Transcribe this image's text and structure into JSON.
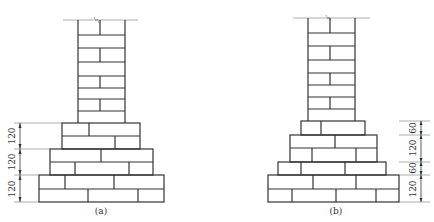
{
  "figure_a": {
    "caption": "(a)",
    "dimensions": [
      "120",
      "120",
      "120"
    ]
  },
  "figure_b": {
    "caption": "(b)",
    "dimensions": [
      "60",
      "120",
      "60",
      "120"
    ]
  }
}
